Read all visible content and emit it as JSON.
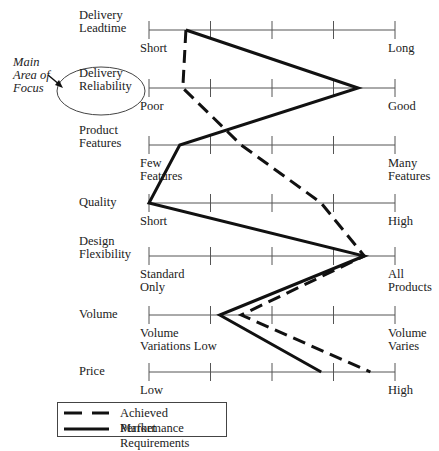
{
  "diagram": {
    "type": "performance-profile",
    "annotation": {
      "text_lines": [
        "Main",
        "Area of",
        "Focus"
      ],
      "highlighted_axis": "Delivery Reliability"
    },
    "axes": [
      {
        "name_lines": [
          "Delivery",
          "Leadtime"
        ],
        "low_lines": [
          "Short"
        ],
        "high_lines": [
          "Long"
        ]
      },
      {
        "name_lines": [
          "Delivery",
          "Reliability"
        ],
        "low_lines": [
          "Poor"
        ],
        "high_lines": [
          "Good"
        ]
      },
      {
        "name_lines": [
          "Product",
          "Features"
        ],
        "low_lines": [
          "Few",
          "Features"
        ],
        "high_lines": [
          "Many",
          "Features"
        ]
      },
      {
        "name_lines": [
          "Quality"
        ],
        "low_lines": [
          "Short"
        ],
        "high_lines": [
          "High"
        ]
      },
      {
        "name_lines": [
          "Design",
          "Flexibility"
        ],
        "low_lines": [
          "Standard",
          "Only"
        ],
        "high_lines": [
          "All",
          "Products"
        ]
      },
      {
        "name_lines": [
          "Volume"
        ],
        "low_lines": [
          "Volume",
          "Variations Low"
        ],
        "high_lines": [
          "Volume",
          "Varies"
        ]
      },
      {
        "name_lines": [
          "Price"
        ],
        "low_lines": [
          "Low"
        ],
        "high_lines": [
          "High"
        ]
      }
    ],
    "scale": {
      "ticks": 5,
      "min": 0,
      "max": 4
    },
    "series": [
      {
        "name": "Achieved Performance",
        "style": "dashed",
        "values": [
          0.6,
          0.55,
          1.5,
          2.8,
          3.5,
          1.5,
          3.6
        ]
      },
      {
        "name": "Market Requirements",
        "style": "solid",
        "values": [
          0.6,
          3.4,
          0.5,
          0,
          3.5,
          1.15,
          2.8
        ]
      }
    ],
    "legend": [
      {
        "label": "Achieved Performance",
        "style": "dashed"
      },
      {
        "label": "Market Requirements",
        "style": "solid"
      }
    ],
    "colors": {
      "line": "#111111",
      "axis": "#555555"
    }
  },
  "chart_data": {
    "type": "line",
    "title": "",
    "categories": [
      "Delivery Leadtime",
      "Delivery Reliability",
      "Product Features",
      "Quality",
      "Design Flexibility",
      "Volume",
      "Price"
    ],
    "series": [
      {
        "name": "Achieved Performance",
        "values": [
          0.6,
          0.55,
          1.5,
          2.8,
          3.5,
          1.5,
          3.6
        ]
      },
      {
        "name": "Market Requirements",
        "values": [
          0.6,
          3.4,
          0.5,
          0.0,
          3.5,
          1.15,
          2.8
        ]
      }
    ],
    "xlabel": "",
    "ylabel": "",
    "xlim": [
      0,
      4
    ],
    "grid": false,
    "legend_position": "bottom-left"
  }
}
